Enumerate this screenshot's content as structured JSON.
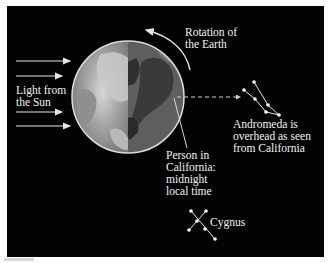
{
  "figure": {
    "background": "#030303",
    "labels": {
      "rotation": "Rotation of\nthe Earth",
      "sunlight": "Light from\nthe Sun",
      "andromeda": "Andromeda is\noverhead as seen\nfrom California",
      "person": "Person in\nCalifornia:\nmidnight\nlocal time",
      "cygnus": "Cygnus"
    },
    "earth": {
      "center": [
        128,
        97
      ],
      "radius": 56,
      "lit_side_color": "#8a8a8a",
      "dark_side_color": "#5c5c5c",
      "outline_color": "#e0e0e0"
    },
    "sun_arrows_count": 4,
    "constellations": [
      {
        "name": "Andromeda",
        "stars": [
          [
            254,
            82
          ],
          [
            244,
            90
          ],
          [
            255,
            99
          ],
          [
            268,
            105
          ],
          [
            266,
            112
          ],
          [
            279,
            115
          ]
        ]
      },
      {
        "name": "Cygnus",
        "stars": [
          [
            191,
            211
          ],
          [
            206,
            211
          ],
          [
            197,
            221
          ],
          [
            189,
            230
          ],
          [
            205,
            229
          ],
          [
            215,
            239
          ]
        ]
      }
    ]
  }
}
